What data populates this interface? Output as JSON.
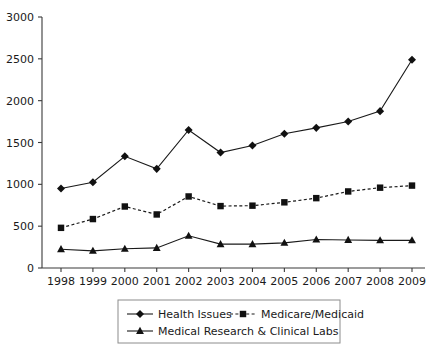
{
  "chart_data": {
    "type": "line",
    "title": "",
    "xlabel": "",
    "ylabel": "",
    "x": [
      "1998",
      "1999",
      "2000",
      "2001",
      "2002",
      "2003",
      "2004",
      "2005",
      "2006",
      "2007",
      "2008",
      "2009"
    ],
    "categories": [
      "1998",
      "1999",
      "2000",
      "2001",
      "2002",
      "2003",
      "2004",
      "2005",
      "2006",
      "2007",
      "2008",
      "2009"
    ],
    "ylim": [
      0,
      3000
    ],
    "yticks": [
      0,
      500,
      1000,
      1500,
      2000,
      2500,
      3000
    ],
    "ytick_labels": [
      "0",
      "500",
      "1000",
      "1500",
      "2000",
      "2500",
      "3000"
    ],
    "grid": false,
    "legend_position": "bottom",
    "series": [
      {
        "name": "Health Issues",
        "marker": "diamond",
        "linestyle": "solid",
        "color": "#111111",
        "values": [
          950,
          1025,
          1335,
          1185,
          1650,
          1380,
          1465,
          1605,
          1675,
          1750,
          1875,
          2490
        ]
      },
      {
        "name": "Medicare/Medicaid",
        "marker": "square",
        "linestyle": "dashed",
        "color": "#111111",
        "values": [
          480,
          585,
          735,
          640,
          855,
          740,
          745,
          785,
          835,
          915,
          960,
          985
        ]
      },
      {
        "name": "Medical Research & Clinical Labs",
        "marker": "triangle",
        "linestyle": "solid",
        "color": "#111111",
        "values": [
          225,
          205,
          230,
          240,
          385,
          285,
          285,
          300,
          340,
          335,
          330,
          330
        ]
      }
    ]
  },
  "legend": {
    "items": [
      {
        "label": "Health Issues",
        "marker": "diamond",
        "linestyle": "solid"
      },
      {
        "label": "Medicare/Medicaid",
        "marker": "square",
        "linestyle": "dashed"
      },
      {
        "label": "Medical Research & Clinical Labs",
        "marker": "triangle",
        "linestyle": "solid"
      }
    ]
  },
  "colors": {
    "ink": "#111111",
    "axis": "#3a3a3a",
    "legend_border": "#8c8c8c",
    "background": "#ffffff"
  }
}
